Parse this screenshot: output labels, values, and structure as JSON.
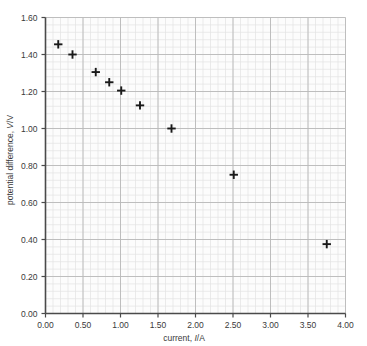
{
  "chart_data": {
    "type": "scatter",
    "title": "",
    "xlabel": "current, I/A",
    "xlabel_parts": {
      "prefix": "current, ",
      "symbol": "I",
      "suffix": "/A"
    },
    "ylabel": "potential difference, V/V",
    "ylabel_parts": {
      "prefix": "potential difference, ",
      "symbol": "V",
      "suffix": "/V"
    },
    "xlim": [
      0.0,
      4.0
    ],
    "ylim": [
      0.0,
      1.6
    ],
    "xticks": [
      "0.00",
      "0.50",
      "1.00",
      "1.50",
      "2.00",
      "2.50",
      "3.00",
      "3.50",
      "4.00"
    ],
    "xtick_values": [
      0.0,
      0.5,
      1.0,
      1.5,
      2.0,
      2.5,
      3.0,
      3.5,
      4.0
    ],
    "yticks": [
      "0.00",
      "0.20",
      "0.40",
      "0.60",
      "0.80",
      "1.00",
      "1.20",
      "1.40",
      "1.60"
    ],
    "ytick_values": [
      0.0,
      0.2,
      0.4,
      0.6,
      0.8,
      1.0,
      1.2,
      1.4,
      1.6
    ],
    "grid": true,
    "grid_major_color": "#b9b9b9",
    "grid_minor_color": "#e3e3e3",
    "grid_minor_divisions": 5,
    "legend": "none",
    "marker": "plus",
    "marker_color": "#1a1a1a",
    "axis_color": "#4a4a4a",
    "plot_background": "#fcfcfc",
    "x": [
      0.17,
      0.36,
      0.67,
      0.85,
      1.01,
      1.26,
      1.68,
      2.51,
      3.75
    ],
    "y": [
      1.455,
      1.4,
      1.305,
      1.25,
      1.205,
      1.125,
      1.0,
      0.75,
      0.375
    ],
    "points": [
      {
        "x": 0.17,
        "y": 1.455
      },
      {
        "x": 0.36,
        "y": 1.4
      },
      {
        "x": 0.67,
        "y": 1.305
      },
      {
        "x": 0.85,
        "y": 1.25
      },
      {
        "x": 1.01,
        "y": 1.205
      },
      {
        "x": 1.26,
        "y": 1.125
      },
      {
        "x": 1.68,
        "y": 1.0
      },
      {
        "x": 2.51,
        "y": 0.75
      },
      {
        "x": 3.75,
        "y": 0.375
      }
    ]
  }
}
